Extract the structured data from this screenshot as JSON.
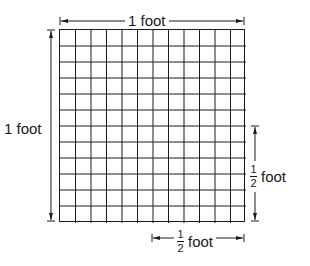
{
  "diagram": {
    "grid": {
      "rows": 12,
      "cols": 12
    },
    "top_label": "1 foot",
    "left_label": "1 foot",
    "right_label": {
      "numerator": "1",
      "denominator": "2",
      "unit": "foot"
    },
    "bottom_label": {
      "numerator": "1",
      "denominator": "2",
      "unit": "foot"
    }
  }
}
